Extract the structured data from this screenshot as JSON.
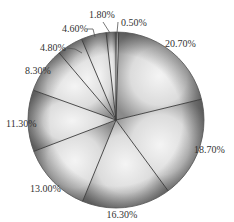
{
  "chart_data": {
    "type": "pie",
    "title": "",
    "start_angle_deg": 0,
    "direction": "clockwise",
    "categories": [
      "A",
      "B",
      "C",
      "D",
      "E",
      "F",
      "G",
      "H",
      "I",
      "J"
    ],
    "values": [
      0.5,
      20.7,
      18.7,
      16.3,
      13.0,
      11.3,
      8.3,
      4.8,
      4.6,
      1.8
    ],
    "labels": [
      "0.50%",
      "20.70%",
      "18.70%",
      "16.30%",
      "13.00%",
      "11.30%",
      "8.30%",
      "4.80%",
      "4.60%",
      "1.80%"
    ],
    "legend": "none",
    "style": "grayscale radial shading, thin dark separators"
  },
  "geometry": {
    "cx": 116,
    "cy": 120,
    "r": 88
  },
  "label_positions": [
    {
      "text": "0.50%",
      "x": 121,
      "y": 26,
      "anchor": "start",
      "leader": [
        [
          118,
          22
        ],
        [
          117,
          33
        ]
      ]
    },
    {
      "text": "20.70%",
      "x": 165,
      "y": 47,
      "anchor": "start",
      "leader": null
    },
    {
      "text": "18.70%",
      "x": 194,
      "y": 153,
      "anchor": "start",
      "leader": null
    },
    {
      "text": "16.30%",
      "x": 122,
      "y": 218,
      "anchor": "middle",
      "leader": null
    },
    {
      "text": "13.00%",
      "x": 30,
      "y": 192,
      "anchor": "start",
      "leader": null
    },
    {
      "text": "11.30%",
      "x": 6,
      "y": 127,
      "anchor": "start",
      "leader": null
    },
    {
      "text": "8.30%",
      "x": 25,
      "y": 74,
      "anchor": "start",
      "leader": null
    },
    {
      "text": "4.80%",
      "x": 40,
      "y": 51,
      "anchor": "start",
      "leader": [
        [
          67,
          48
        ],
        [
          75,
          49
        ],
        [
          82,
          53
        ]
      ]
    },
    {
      "text": "4.60%",
      "x": 62,
      "y": 32,
      "anchor": "start",
      "leader": [
        [
          87,
          29
        ],
        [
          93,
          29
        ],
        [
          95,
          37
        ]
      ]
    },
    {
      "text": "1.80%",
      "x": 89,
      "y": 18,
      "anchor": "start",
      "leader": [
        [
          103,
          22
        ],
        [
          110,
          33
        ]
      ]
    }
  ]
}
